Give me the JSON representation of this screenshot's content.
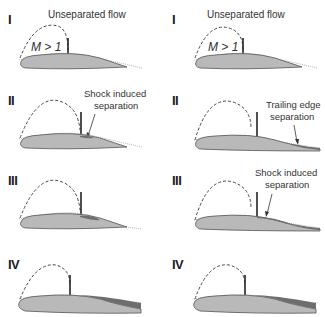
{
  "figure": {
    "colors": {
      "airfoil_fill": "#b9b9b9",
      "airfoil_outline": "#555555",
      "separated_region": "#6e6e6e",
      "shock": "#222222",
      "sonic_line": "#444444",
      "boundary_layer": "#9a9a9a"
    },
    "left_column": {
      "panels": [
        {
          "numeral": "I",
          "label": "Unseparated flow",
          "mach_label": "M > 1"
        },
        {
          "numeral": "II",
          "label_line1": "Shock induced",
          "label_line2": "separation"
        },
        {
          "numeral": "III"
        },
        {
          "numeral": "IV"
        }
      ]
    },
    "right_column": {
      "panels": [
        {
          "numeral": "I",
          "label": "Unseparated flow",
          "mach_label": "M > 1"
        },
        {
          "numeral": "II",
          "label_line1": "Trailing edge",
          "label_line2": "separation"
        },
        {
          "numeral": "III",
          "label_line1": "Shock induced",
          "label_line2": "separation"
        },
        {
          "numeral": "IV"
        }
      ]
    }
  }
}
